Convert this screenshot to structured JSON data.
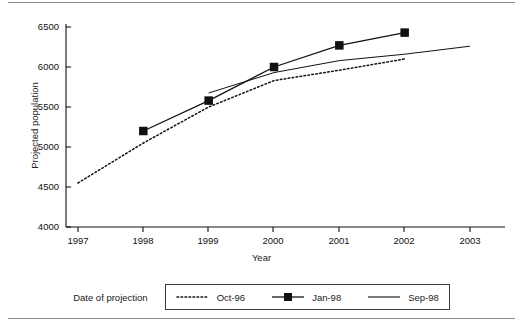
{
  "chart_data": {
    "type": "line",
    "title": "",
    "xlabel": "Year",
    "ylabel": "Projected population",
    "xlim": [
      1997,
      2003
    ],
    "ylim": [
      4000,
      6500
    ],
    "xticks": [
      "1997",
      "1998",
      "1999",
      "2000",
      "2001",
      "2002",
      "2003"
    ],
    "yticks": [
      "4000",
      "4500",
      "5000",
      "5500",
      "6000",
      "6500"
    ],
    "grid": false,
    "legend_position": "bottom",
    "legend_title": "Date of projection",
    "series": [
      {
        "name": "Oct-96",
        "style": "dotted",
        "marker": "none",
        "x": [
          1997,
          1998,
          1999,
          2000,
          2001,
          2002
        ],
        "values": [
          4550,
          5050,
          5500,
          5830,
          5960,
          6100
        ]
      },
      {
        "name": "Jan-98",
        "style": "solid",
        "marker": "square",
        "x": [
          1998,
          1999,
          2000,
          2001,
          2002
        ],
        "values": [
          5200,
          5580,
          6000,
          6270,
          6430
        ]
      },
      {
        "name": "Sep-98",
        "style": "solid",
        "marker": "none",
        "x": [
          1999,
          2000,
          2001,
          2002,
          2003
        ],
        "values": [
          5675,
          5930,
          6080,
          6160,
          6260
        ]
      }
    ]
  },
  "axes": {
    "y_title": "Projected population",
    "x_title": "Year",
    "y_tick_labels": [
      "6500",
      "6000",
      "5500",
      "5000",
      "4500",
      "4000"
    ],
    "x_tick_labels": [
      "1997",
      "1998",
      "1999",
      "2000",
      "2001",
      "2002",
      "2003"
    ]
  },
  "legend": {
    "title": "Date of projection",
    "entries": [
      {
        "label": "Oct-96",
        "swatch": "dotted-line-swatch"
      },
      {
        "label": "Jan-98",
        "swatch": "solid-line-square-marker-swatch"
      },
      {
        "label": "Sep-98",
        "swatch": "solid-line-swatch"
      }
    ]
  },
  "colors": {
    "ink": "#111111",
    "frame": "#8a8a8a",
    "background": "#ffffff"
  }
}
